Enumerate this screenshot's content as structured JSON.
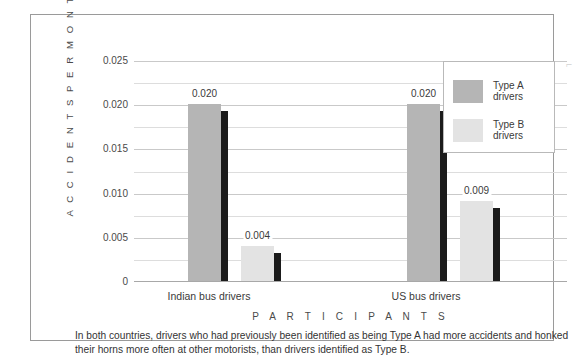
{
  "figure": {
    "scan_artifact_glyph": "⌐"
  },
  "chart_data": {
    "type": "bar",
    "title": "",
    "xlabel": "P A R T I C I P A N T S",
    "ylabel": "A C C I D E N T S   P E R   M O N T H",
    "categories": [
      "Indian bus drivers",
      "US bus drivers"
    ],
    "series": [
      {
        "name": "Type A\ndrivers",
        "color": "#b5b5b5",
        "values": [
          0.02,
          0.02
        ],
        "labels": [
          "0.020",
          "0.020"
        ]
      },
      {
        "name": "Type B\ndrivers",
        "color": "#e3e3e3",
        "values": [
          0.004,
          0.009
        ],
        "labels": [
          "0.004",
          "0.009"
        ]
      }
    ],
    "ylim": [
      0,
      0.025
    ],
    "yticks": [
      0.025,
      0.02,
      0.015,
      0.01,
      0.005,
      0
    ],
    "ytick_labels": [
      "0.025",
      "0.020",
      "0.015",
      "0.010",
      "0.005",
      "0"
    ],
    "minor_gridlines": true,
    "minor_ytick_values": [
      0.0225,
      0.0175,
      0.0125,
      0.0075,
      0.0025
    ],
    "grid": true,
    "legend_position": "top-right",
    "bar_shadow_color": "#1b1b1b"
  },
  "legend": {
    "items": [
      {
        "label": "Type A\ndrivers",
        "color": "#b5b5b5"
      },
      {
        "label": "Type B\ndrivers",
        "color": "#e3e3e3"
      }
    ]
  },
  "caption": {
    "text": "In both countries, drivers who had previously been identified as being Type A had more accidents and honked their horns more often at other motorists, than drivers identified as Type B."
  }
}
